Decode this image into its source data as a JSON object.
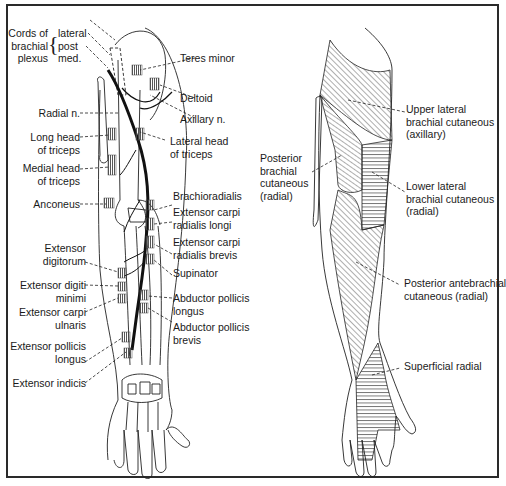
{
  "figure": {
    "left_panel": {
      "title": "Radial nerve motor innervation (posterior arm)",
      "brachial_plexus": {
        "group_label": [
          "Cords of",
          "brachial",
          "plexus"
        ],
        "cords": [
          "lateral",
          "post",
          "med."
        ]
      },
      "labels_left": [
        {
          "id": "radial-n",
          "lines": [
            "Radial n."
          ]
        },
        {
          "id": "long-head-triceps",
          "lines": [
            "Long head",
            "of triceps"
          ]
        },
        {
          "id": "medial-head-triceps",
          "lines": [
            "Medial head",
            "of triceps"
          ]
        },
        {
          "id": "anconeus",
          "lines": [
            "Anconeus"
          ]
        },
        {
          "id": "extensor-digitorum",
          "lines": [
            "Extensor",
            "digitorum"
          ]
        },
        {
          "id": "extensor-digiti-minimi",
          "lines": [
            "Extensor digiti",
            "minimi"
          ]
        },
        {
          "id": "extensor-carpi-ulnaris",
          "lines": [
            "Extensor carpi",
            "ulnaris"
          ]
        },
        {
          "id": "extensor-pollicis-longus",
          "lines": [
            "Extensor pollicis",
            "longus"
          ]
        },
        {
          "id": "extensor-indicis",
          "lines": [
            "Extensor indicis"
          ]
        }
      ],
      "labels_right": [
        {
          "id": "teres-minor",
          "lines": [
            "Teres minor"
          ]
        },
        {
          "id": "deltoid",
          "lines": [
            "Deltoid"
          ]
        },
        {
          "id": "axillary-n",
          "lines": [
            "Axillary n."
          ]
        },
        {
          "id": "lateral-head-triceps",
          "lines": [
            "Lateral head",
            "of triceps"
          ]
        },
        {
          "id": "brachioradialis",
          "lines": [
            "Brachioradialis"
          ]
        },
        {
          "id": "ecr-longus",
          "lines": [
            "Extensor carpi",
            "radialis longi"
          ]
        },
        {
          "id": "ecr-brevis",
          "lines": [
            "Extensor carpi",
            "radialis brevis"
          ]
        },
        {
          "id": "supinator",
          "lines": [
            "Supinator"
          ]
        },
        {
          "id": "abductor-pollicis-longus",
          "lines": [
            "Abductor pollicis",
            "longus"
          ]
        },
        {
          "id": "abductor-pollicis-brevis",
          "lines": [
            "Abductor pollicis",
            "brevis"
          ]
        }
      ]
    },
    "right_panel": {
      "title": "Cutaneous sensory distribution",
      "labels": [
        {
          "id": "posterior-brachial-cutaneous",
          "lines": [
            "Posterior",
            "brachial",
            "cutaneous",
            "(radial)"
          ]
        },
        {
          "id": "upper-lateral-brachial-cutaneous",
          "lines": [
            "Upper lateral",
            "brachial cutaneous",
            "(axillary)"
          ]
        },
        {
          "id": "lower-lateral-brachial-cutaneous",
          "lines": [
            "Lower lateral",
            "brachial cutaneous",
            "(radial)"
          ]
        },
        {
          "id": "posterior-antebrachial-cutaneous",
          "lines": [
            "Posterior antebrachial",
            "cutaneous (radial)"
          ]
        },
        {
          "id": "superficial-radial",
          "lines": [
            "Superficial radial"
          ]
        }
      ]
    },
    "colors": {
      "ink": "#1a1a1a",
      "border": "#2a2a2a",
      "background": "#ffffff"
    }
  }
}
